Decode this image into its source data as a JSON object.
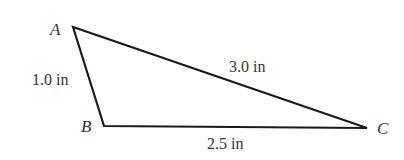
{
  "diagram": {
    "type": "triangle",
    "vertices": [
      {
        "name": "A",
        "x": 73,
        "y": 27
      },
      {
        "name": "B",
        "x": 104,
        "y": 126
      },
      {
        "name": "C",
        "x": 367,
        "y": 128
      }
    ],
    "sides": [
      {
        "from": "A",
        "to": "B",
        "label": "1.0 in"
      },
      {
        "from": "B",
        "to": "C",
        "label": "2.5 in"
      },
      {
        "from": "A",
        "to": "C",
        "label": "3.0 in"
      }
    ],
    "stroke_color": "#1a1a1a",
    "label_color": "#333333"
  }
}
